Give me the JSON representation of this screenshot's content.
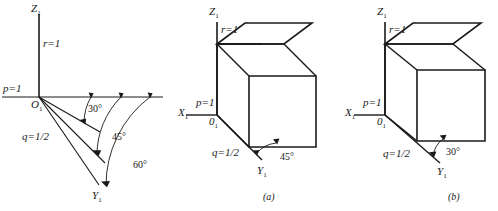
{
  "figure": {
    "stroke_color": "#1a1a1a",
    "background_color": "#ffffff"
  },
  "panels": [
    {
      "id": "left",
      "caption": "",
      "axes": {
        "z_label": "Z",
        "z_sub": "1",
        "y_label": "Y",
        "y_sub": "1",
        "origin_label": "O",
        "origin_sub": "1"
      },
      "scales": {
        "p": "p=1",
        "q": "q=1/2",
        "r": "r=1"
      },
      "angles": [
        {
          "value": "30",
          "label": "30°"
        },
        {
          "value": "45",
          "label": "45°"
        },
        {
          "value": "60",
          "label": "60°"
        }
      ]
    },
    {
      "id": "middle",
      "caption": "(a)",
      "axes": {
        "z_label": "Z",
        "z_sub": "1",
        "y_label": "Y",
        "y_sub": "1",
        "x_label": "X",
        "x_sub": "1",
        "origin_label": "0",
        "origin_sub": "1"
      },
      "scales": {
        "p": "p=1",
        "q": "q=1/2",
        "r": "r=1"
      },
      "angles": [
        {
          "value": "45",
          "label": "45°"
        }
      ]
    },
    {
      "id": "right",
      "caption": "(b)",
      "axes": {
        "z_label": "Z",
        "z_sub": "1",
        "y_label": "Y",
        "y_sub": "1",
        "x_label": "X",
        "x_sub": "1",
        "origin_label": "0",
        "origin_sub": "1"
      },
      "scales": {
        "p": "p=1",
        "q": "q=1/2",
        "r": "r=1"
      },
      "angles": [
        {
          "value": "30",
          "label": "30°"
        }
      ]
    }
  ]
}
